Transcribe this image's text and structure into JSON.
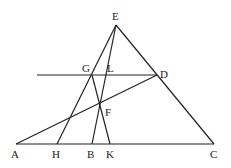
{
  "diagram": {
    "type": "geometry",
    "points": [
      {
        "name": "E",
        "x": 116,
        "y": 25,
        "label": "E",
        "lx": 112,
        "ly": 20
      },
      {
        "name": "G",
        "x": 92,
        "y": 75,
        "label": "G",
        "lx": 82,
        "ly": 72
      },
      {
        "name": "L",
        "x": 105,
        "y": 75,
        "label": "L",
        "lx": 107,
        "ly": 72
      },
      {
        "name": "D",
        "x": 157,
        "y": 75,
        "label": "D",
        "lx": 160,
        "ly": 78
      },
      {
        "name": "F",
        "x": 99,
        "y": 103,
        "label": "F",
        "lx": 105,
        "ly": 116
      },
      {
        "name": "A",
        "x": 16,
        "y": 144,
        "label": "A",
        "lx": 11,
        "ly": 158
      },
      {
        "name": "H",
        "x": 57,
        "y": 144,
        "label": "H",
        "lx": 52,
        "ly": 158
      },
      {
        "name": "B",
        "x": 92,
        "y": 144,
        "label": "B",
        "lx": 87,
        "ly": 158
      },
      {
        "name": "K",
        "x": 110,
        "y": 144,
        "label": "K",
        "lx": 106,
        "ly": 158
      },
      {
        "name": "C",
        "x": 214,
        "y": 144,
        "label": "C",
        "lx": 210,
        "ly": 158
      }
    ],
    "segments": [
      {
        "from": "A",
        "to": "C",
        "x1": 16,
        "y1": 144,
        "x2": 214,
        "y2": 144
      },
      {
        "from": "E",
        "to": "C",
        "x1": 116,
        "y1": 25,
        "x2": 214,
        "y2": 144
      },
      {
        "from": "E",
        "to": "H",
        "x1": 116,
        "y1": 25,
        "x2": 57,
        "y2": 144
      },
      {
        "from": "E",
        "to": "B",
        "x1": 116,
        "y1": 25,
        "x2": 92,
        "y2": 144
      },
      {
        "from": "G",
        "to": "K",
        "x1": 92,
        "y1": 75,
        "x2": 110,
        "y2": 144
      },
      {
        "from": "A",
        "to": "D",
        "x1": 16,
        "y1": 144,
        "x2": 157,
        "y2": 75
      },
      {
        "from": "line-left",
        "to": "D",
        "x1": 37,
        "y1": 75,
        "x2": 157,
        "y2": 75
      }
    ]
  }
}
